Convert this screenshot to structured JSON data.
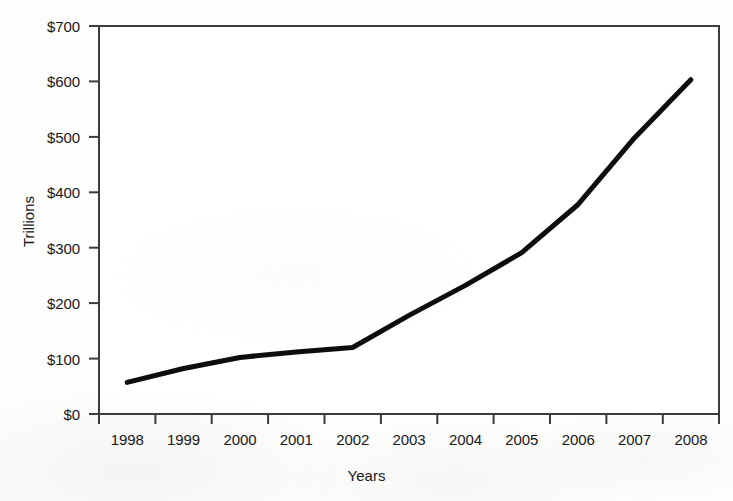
{
  "chart_data": {
    "type": "line",
    "title": "",
    "xlabel": "Years",
    "ylabel": "Trillions",
    "categories": [
      "1998",
      "1999",
      "2000",
      "2001",
      "2002",
      "2003",
      "2004",
      "2005",
      "2006",
      "2007",
      "2008"
    ],
    "values": [
      57,
      82,
      102,
      112,
      120,
      178,
      232,
      291,
      378,
      498,
      603
    ],
    "series": [
      {
        "name": "Trillions",
        "values": [
          57,
          82,
          102,
          112,
          120,
          178,
          232,
          291,
          378,
          498,
          603
        ]
      }
    ],
    "ylim": [
      0,
      700
    ],
    "ytick_values": [
      0,
      100,
      200,
      300,
      400,
      500,
      600,
      700
    ],
    "ytick_labels": [
      "$0",
      "$100",
      "$200",
      "$300",
      "$400",
      "$500",
      "$600",
      "$700"
    ],
    "xtick_labels": [
      "1998",
      "1999",
      "2000",
      "2001",
      "2002",
      "2003",
      "2004",
      "2005",
      "2006",
      "2007",
      "2008"
    ],
    "grid": false,
    "legend": false,
    "legend_position": "none",
    "line_color": "#0d0d0d",
    "line_width_px": 5,
    "axis_color": "#3c3c3c",
    "background_color": "#fdfdfc",
    "frame": "full-box",
    "annotations": []
  },
  "axis": {
    "y_title": "Trillions",
    "x_title": "Years"
  }
}
